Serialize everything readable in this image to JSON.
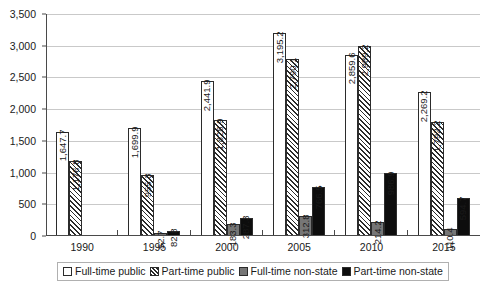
{
  "chart_data": {
    "type": "bar",
    "title": "",
    "subtitle": "",
    "xlabel": "",
    "ylabel": "",
    "ylim": [
      0,
      3500
    ],
    "ytick_step": 500,
    "ytick_labels": [
      "0",
      "500",
      "1,000",
      "1,500",
      "2,000",
      "2,500",
      "3,000",
      "3,500"
    ],
    "ytick_values": [
      0,
      500,
      1000,
      1500,
      2000,
      2500,
      3000,
      3500
    ],
    "grid": true,
    "grid_axis": "y",
    "legend_position": "bottom",
    "categories": [
      "1990",
      "1995",
      "2000",
      "2005",
      "2010",
      "2015"
    ],
    "series": [
      {
        "name": "Full-time public",
        "style": "white-outline",
        "color": "#ffffff",
        "values": [
          1647.7,
          1699.9,
          2441.9,
          3195.2,
          2859.6,
          2269.2
        ],
        "labels": [
          "1,647.7",
          "1,699.9",
          "2,441.9",
          "3,195.2",
          "2,859.6",
          "2,269.2"
        ]
      },
      {
        "name": "Part-time public",
        "style": "diagonal-hatch",
        "color": "#2b2b2b",
        "values": [
          1176.8,
          955.3,
          1828.9,
          2790.1,
          2989.2,
          1792.2
        ],
        "labels": [
          "1,176.8",
          "955.3",
          "1,828.9",
          "2,790.1",
          "2,989.2",
          "1,792.2"
        ]
      },
      {
        "name": "Full-time non-state",
        "style": "solid-gray",
        "color": "#767676",
        "values": [
          null,
          52.7,
          183.3,
          312.8,
          214.2,
          110.4
        ],
        "labels": [
          "",
          "52.7",
          "183.3",
          "312.8",
          "214.2",
          "110.4"
        ]
      },
      {
        "name": "Part-time non-state",
        "style": "solid-black",
        "color": "#0d0d0d",
        "values": [
          null,
          82.8,
          287.3,
          766.5,
          986.9,
          594.7
        ],
        "labels": [
          "",
          "82.8",
          "287.3",
          "766.5",
          "986.9",
          "594.7"
        ]
      }
    ]
  },
  "legend": {
    "items": [
      {
        "label": "Full-time public"
      },
      {
        "label": "Part-time public"
      },
      {
        "label": "Full-time non-state"
      },
      {
        "label": "Part-time non-state"
      }
    ]
  }
}
